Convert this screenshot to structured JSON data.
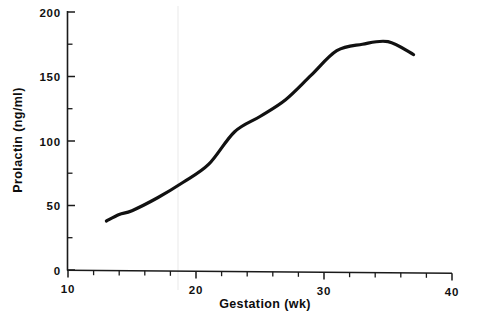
{
  "figure": {
    "background_color": "#ffffff",
    "ink_color": "#111111",
    "artifact_line_color": "#e8e8e8"
  },
  "axes": {
    "x_title": "Gestation  (wk)",
    "y_title": "Prolactin  (ng/ml)",
    "x_tick_labels": [
      "10",
      "20",
      "30",
      "40"
    ],
    "y_tick_labels": [
      "0",
      "50",
      "100",
      "150",
      "200"
    ]
  },
  "chart_data": {
    "type": "line",
    "title": "",
    "xlabel": "Gestation  (wk)",
    "ylabel": "Prolactin  (ng/ml)",
    "xlim": [
      10,
      40
    ],
    "ylim": [
      0,
      200
    ],
    "xticks": [
      10,
      20,
      30,
      40
    ],
    "yticks": [
      0,
      50,
      100,
      150,
      200
    ],
    "x_minor_ticks": [
      12,
      14,
      16,
      18,
      22,
      24,
      26,
      28,
      32,
      34,
      36,
      38
    ],
    "y_minor_ticks": [
      25,
      75,
      125,
      175
    ],
    "grid": false,
    "legend": null,
    "series": [
      {
        "name": "Serum prolactin",
        "line_color": "#111111",
        "line_width": 3.2,
        "x": [
          13.0,
          14.0,
          15.0,
          17.0,
          19.0,
          21.0,
          23.0,
          25.0,
          27.0,
          29.0,
          31.0,
          33.0,
          35.0,
          37.0
        ],
        "values": [
          38,
          43,
          46,
          56,
          68,
          82,
          107,
          119,
          132,
          151,
          170,
          175,
          177,
          167
        ]
      }
    ]
  }
}
